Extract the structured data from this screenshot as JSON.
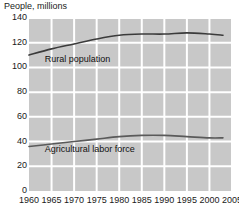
{
  "chart_data": {
    "type": "line",
    "title": "People, millions",
    "xlabel": "",
    "ylabel": "People, millions",
    "xlim": [
      1960,
      2005
    ],
    "ylim": [
      0,
      140
    ],
    "grid": true,
    "legend_position": "inline-annotations",
    "xticks": [
      1960,
      1965,
      1970,
      1975,
      1980,
      1985,
      1990,
      1995,
      2000,
      2005
    ],
    "yticks": [
      0,
      20,
      40,
      60,
      80,
      100,
      120,
      140
    ],
    "x": [
      1960,
      1965,
      1970,
      1975,
      1980,
      1985,
      1990,
      1995,
      2000,
      2003
    ],
    "series": [
      {
        "name": "Rural population",
        "values": [
          110,
          115,
          119,
          123,
          126,
          127,
          127,
          128,
          127,
          126
        ],
        "color": "#3b3b3b",
        "label_x": 1963.5,
        "label_y": 106
      },
      {
        "name": "Agricultural labor force",
        "values": [
          36,
          38,
          40,
          42,
          44,
          45,
          45,
          44,
          43,
          43
        ],
        "color": "#5a5a5a",
        "label_x": 1963.5,
        "label_y": 33
      }
    ]
  },
  "style": {
    "plot_background": "#c8c8c8",
    "gridline_color": "#ffffff",
    "text_color": "#1a1a1a",
    "page_background": "#ffffff"
  },
  "plot_geometry": {
    "left": 29,
    "top": 18,
    "right": 232,
    "bottom": 191
  }
}
